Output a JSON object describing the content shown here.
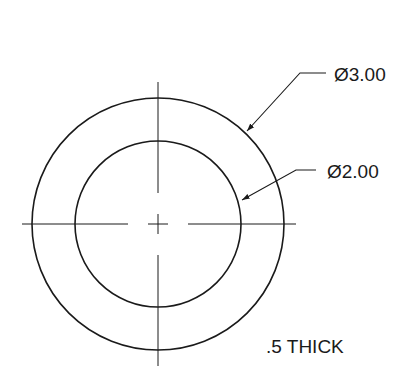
{
  "drawing": {
    "title": "Washer drawing",
    "outer_diameter_label": "Ø3.00",
    "inner_diameter_label": "Ø2.00",
    "thickness_note": ".5 THICK"
  },
  "geometry": {
    "center": [
      158,
      224
    ],
    "outer_radius": 126,
    "inner_radius": 83
  },
  "colors": {
    "line": "#1a1a1a",
    "background": "#ffffff"
  }
}
